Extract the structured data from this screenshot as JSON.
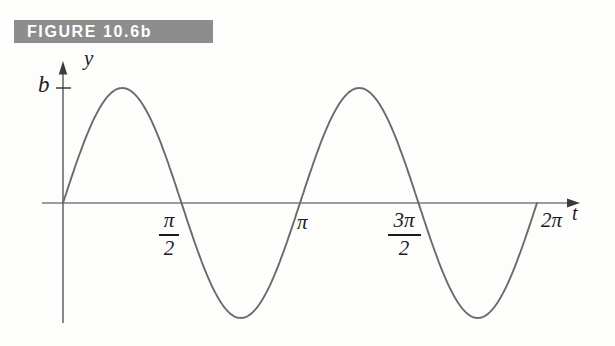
{
  "figure_header": {
    "label": "FIGURE 10.6b",
    "bg_color": "#8d8d8d",
    "text_color": "#ffffff"
  },
  "chart_data": {
    "type": "line",
    "title": "FIGURE 10.6b",
    "xlabel": "t",
    "ylabel": "y",
    "function": "y = b sin 2t",
    "amplitude": 1,
    "amplitude_label": "b",
    "angular_frequency": 2,
    "x_range": [
      0,
      6.2831853
    ],
    "y_range": [
      -1,
      1
    ],
    "x_ticks": [
      {
        "value": 1.5708,
        "label": "π/2",
        "fraction": true,
        "numerator": "π",
        "denominator": "2"
      },
      {
        "value": 3.1416,
        "label": "π",
        "fraction": false
      },
      {
        "value": 4.7124,
        "label": "3π/2",
        "fraction": true,
        "numerator": "3π",
        "denominator": "2"
      },
      {
        "value": 6.2832,
        "label": "2π",
        "fraction": false
      }
    ],
    "y_ticks": [
      {
        "value": 1,
        "label": "b"
      }
    ],
    "series": [
      {
        "name": "y = b sin 2t",
        "key_points_t": [
          0,
          0.7854,
          1.5708,
          2.3562,
          3.1416,
          3.927,
          4.7124,
          5.4978,
          6.2832
        ],
        "key_points_y": [
          "0",
          "b",
          "0",
          "-b",
          "0",
          "b",
          "0",
          "-b",
          "0"
        ]
      }
    ],
    "grid": false,
    "legend": false,
    "curve_color": "#6a6a6a",
    "axis_color": "#3c3c3c"
  }
}
